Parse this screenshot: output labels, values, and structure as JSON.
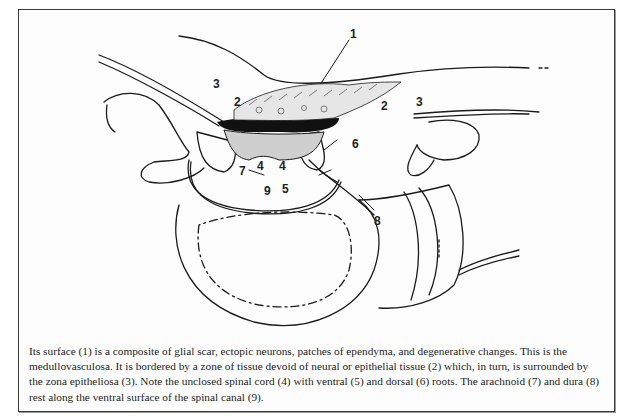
{
  "figure": {
    "labels": {
      "l1": "1",
      "l2a": "2",
      "l2b": "2",
      "l3a": "3",
      "l3b": "3",
      "l4a": "4",
      "l4b": "4",
      "l5": "5",
      "l6": "6",
      "l7": "7",
      "l8": "8",
      "l9": "9"
    },
    "caption": "Its surface (1) is a composite of glial scar, ectopic neurons, patches of ependyma, and degenerative changes. This is the medullovasculosa. It is bordered by a zone of tissue devoid of neural or epithelial tissue (2) which, in turn, is surrounded by the zona epitheliosa (3). Note the unclosed spinal cord (4) with ventral (5) and dorsal (6) roots. The arachnoid (7) and dura (8) rest along the ventral surface of the spinal canal (9)."
  },
  "colors": {
    "line": "#1a1a1a",
    "frame": "#3a3a3a",
    "background": "#ffffff"
  }
}
